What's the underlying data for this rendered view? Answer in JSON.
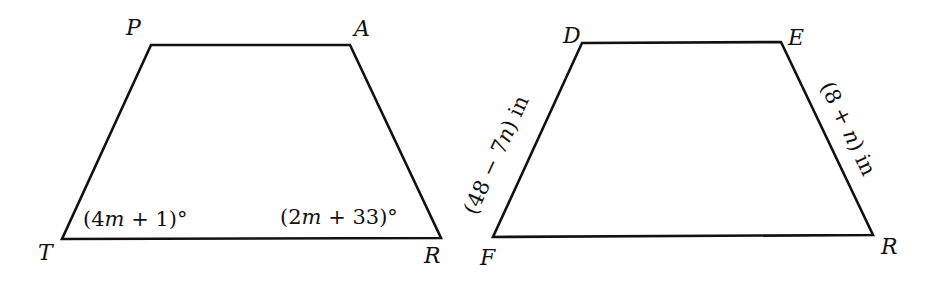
{
  "figures": [
    {
      "name": "trapezoid-PART",
      "vertices": [
        {
          "label": "P",
          "x": 151,
          "y": 45
        },
        {
          "label": "A",
          "x": 350,
          "y": 45
        },
        {
          "label": "R",
          "x": 441,
          "y": 238
        },
        {
          "label": "T",
          "x": 62,
          "y": 239
        }
      ],
      "angle_labels": [
        {
          "at": "T",
          "pre": "(4",
          "var": "m",
          "post": " + 1)°"
        },
        {
          "at": "R",
          "pre": "(2",
          "var": "m",
          "post": " + 33)°"
        }
      ]
    },
    {
      "name": "trapezoid-DERF",
      "vertices": [
        {
          "label": "D",
          "x": 582,
          "y": 43
        },
        {
          "label": "E",
          "x": 781,
          "y": 42
        },
        {
          "label": "R",
          "x": 873,
          "y": 235
        },
        {
          "label": "F",
          "x": 493,
          "y": 237
        }
      ],
      "side_labels": [
        {
          "side": "DF",
          "pre": "(48 − 7",
          "var": "n",
          "post": ") in"
        },
        {
          "side": "ER",
          "pre": "(8 + ",
          "var": "n",
          "post": ") in"
        }
      ]
    }
  ],
  "colors": {
    "stroke": "#111111",
    "background": "#ffffff"
  }
}
